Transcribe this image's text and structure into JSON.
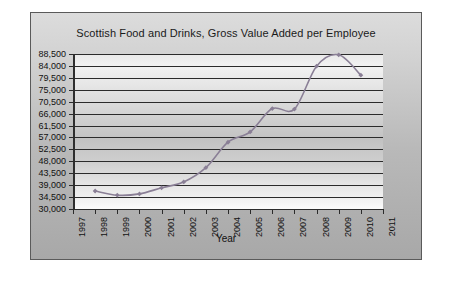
{
  "chart_data": {
    "type": "line",
    "title": "Scottish Food and Drinks, Gross Value Added per Employee",
    "xlabel": "Year",
    "ylabel": "",
    "grid": true,
    "legend": false,
    "xlim": [
      1997,
      2011
    ],
    "ylim": [
      30000,
      88500
    ],
    "x_tick_labels": [
      "1997",
      "1998",
      "1999",
      "2000",
      "2001",
      "2002",
      "2003",
      "2004",
      "2005",
      "2006",
      "2007",
      "2008",
      "2009",
      "2010",
      "2011"
    ],
    "y_tick_labels": [
      "88,500",
      "84,000",
      "79,500",
      "75,000",
      "70,500",
      "66,000",
      "61,500",
      "57,000",
      "52,500",
      "48,000",
      "43,500",
      "39,000",
      "34,500",
      "30,000"
    ],
    "y_tick_values": [
      88500,
      84000,
      79500,
      75000,
      70500,
      66000,
      61500,
      57000,
      52500,
      48000,
      43500,
      39000,
      34500,
      30000
    ],
    "y_tick_step": 4500,
    "series": [
      {
        "name": "Gross Value Added per Employee",
        "color": "#8a7f96",
        "marker": "diamond",
        "x": [
          1998,
          1999,
          2000,
          2001,
          2002,
          2003,
          2004,
          2005,
          2006,
          2007,
          2008,
          2009,
          2010
        ],
        "values": [
          36800,
          35200,
          35700,
          38000,
          40200,
          45600,
          55200,
          59100,
          67900,
          67700,
          83900,
          88200,
          80500
        ]
      }
    ]
  },
  "chart": {
    "title": "Scottish Food and Drinks, Gross Value Added per Employee",
    "x_axis_title": "Year"
  }
}
